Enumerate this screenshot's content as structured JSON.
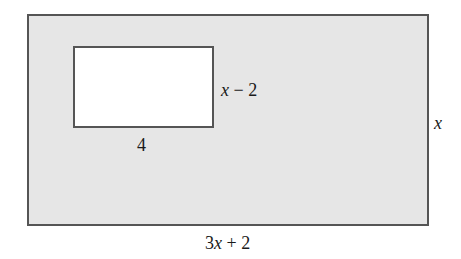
{
  "diagram": {
    "colors": {
      "outer_fill": "#e6e6e6",
      "inner_fill": "#ffffff",
      "stroke": "#555555",
      "text": "#1a1a1a"
    },
    "outer_rectangle": {
      "width_label": {
        "var": "3x",
        "rest": " + 2",
        "full": "3x + 2"
      },
      "height_label": {
        "var": "x",
        "full": "x"
      }
    },
    "inner_rectangle": {
      "width_label": {
        "full": "4"
      },
      "height_label": {
        "var": "x",
        "rest": " − 2",
        "full": "x − 2"
      }
    }
  }
}
